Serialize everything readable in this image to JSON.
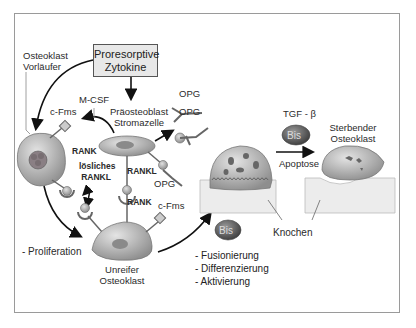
{
  "title_box": {
    "line1": "Proresorptive",
    "line2": "Zytokine"
  },
  "cells": {
    "precursor": {
      "line1": "Osteoklast",
      "line2": "Vorläufer"
    },
    "preosteoblast": {
      "line1": "Präosteoblast",
      "line2": "Stromazelle"
    },
    "immature": {
      "line1": "Unreifer",
      "line2": "Osteoklast"
    },
    "dying": {
      "line1": "Sterbender",
      "line2": "Osteoklast"
    }
  },
  "molecules": {
    "mcsf": "M-CSF",
    "cfms_top": "c-Fms",
    "cfms_bottom": "c-Fms",
    "rank_top": "RANK",
    "rank_bottom": "RANK",
    "soluble_rankl": {
      "line1": "lösliches",
      "line2": "RANKL"
    },
    "rankl": "RANKL",
    "opg_1": "OPG",
    "opg_2": "OPG",
    "opg_3": "OPG",
    "tgf": "TGF - β",
    "bis_top": "Bis",
    "bis_bottom": "Bis"
  },
  "labels": {
    "apoptose": "Apoptose",
    "knochen": "Knochen",
    "proliferation": "- Proliferation"
  },
  "process_list": [
    "- Fusionierung",
    "- Differenzierung",
    "- Aktivierung"
  ],
  "colors": {
    "frame": "#9a9a9a",
    "cell_fill": "#b8b8b8",
    "nucleus": "#7a7a7a",
    "bone": "#ececec",
    "bis": "#5a5a5a",
    "box": "#e8e8e8"
  }
}
